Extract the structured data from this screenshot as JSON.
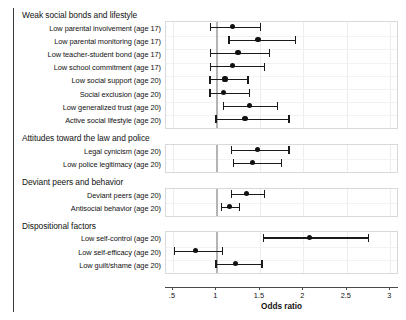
{
  "chart_data": {
    "type": "scatter",
    "subtype": "forest-plot",
    "title": "",
    "xlabel": "Odds ratio",
    "ylabel": "",
    "xlim": [
      0.42,
      3.1
    ],
    "xticks": [
      0.5,
      1,
      1.5,
      2,
      2.5,
      3
    ],
    "xtick_labels": [
      ".5",
      "1",
      "1.5",
      "2",
      "2.5",
      "3"
    ],
    "reference_line": 1,
    "grid": true,
    "legend": null,
    "effect_measure": "Odds ratio",
    "groups": [
      {
        "title": "Weak social bonds and lifestyle",
        "rows": [
          {
            "label": "Low parental involvement (age 17)",
            "estimate": 1.2,
            "ci_low": 0.94,
            "ci_high": 1.52
          },
          {
            "label": "Low parental monitoring (age 17)",
            "estimate": 1.49,
            "ci_low": 1.15,
            "ci_high": 1.93
          },
          {
            "label": "Low teacher-student bond (age 17)",
            "estimate": 1.26,
            "ci_low": 0.94,
            "ci_high": 1.63
          },
          {
            "label": "Low school commitment (age 17)",
            "estimate": 1.2,
            "ci_low": 0.94,
            "ci_high": 1.57
          },
          {
            "label": "Low social support (age 20)",
            "estimate": 1.11,
            "ci_low": 0.93,
            "ci_high": 1.38
          },
          {
            "label": "Social exclusion (age 20)",
            "estimate": 1.09,
            "ci_low": 0.93,
            "ci_high": 1.4
          },
          {
            "label": "Low generalized trust (age 20)",
            "estimate": 1.39,
            "ci_low": 1.09,
            "ci_high": 1.72
          },
          {
            "label": "Active social lifestyle (age 20)",
            "estimate": 1.34,
            "ci_low": 1.0,
            "ci_high": 1.85
          }
        ]
      },
      {
        "title": "Attitudes toward the law and police",
        "rows": [
          {
            "label": "Legal cynicism (age 20)",
            "estimate": 1.48,
            "ci_low": 1.18,
            "ci_high": 1.85
          },
          {
            "label": "Low police legitimacy (age 20)",
            "estimate": 1.43,
            "ci_low": 1.2,
            "ci_high": 1.76
          }
        ]
      },
      {
        "title": "Deviant peers and behavior",
        "rows": [
          {
            "label": "Deviant peers (age 20)",
            "estimate": 1.36,
            "ci_low": 1.18,
            "ci_high": 1.57
          },
          {
            "label": "Antisocial behavior (age 20)",
            "estimate": 1.16,
            "ci_low": 1.06,
            "ci_high": 1.28
          }
        ]
      },
      {
        "title": "Dispositional factors",
        "rows": [
          {
            "label": "Low self-control (age 20)",
            "estimate": 2.08,
            "ci_low": 1.55,
            "ci_high": 2.77
          },
          {
            "label": "Low self-efficacy (age 20)",
            "estimate": 0.77,
            "ci_low": 0.52,
            "ci_high": 1.09
          },
          {
            "label": "Low guilt/shame (age 20)",
            "estimate": 1.23,
            "ci_low": 1.0,
            "ci_high": 1.54
          }
        ]
      }
    ]
  },
  "colors": {
    "marker": "#111111",
    "whisker": "#1a1a1a",
    "reference_line": "#b4b4b4",
    "gridline": "#ededed",
    "panel_border": "#d9d9d9",
    "axis": "#4a4a4a",
    "text": "#111111"
  }
}
